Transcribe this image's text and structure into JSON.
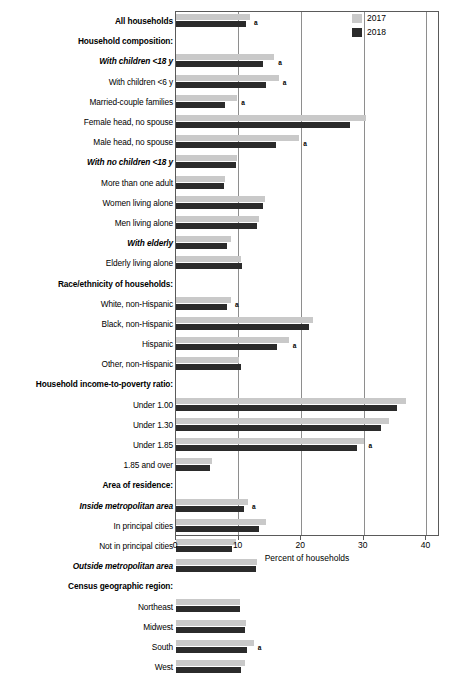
{
  "chart_data": {
    "type": "bar",
    "orientation": "horizontal",
    "title": "",
    "xlabel": "Percent of households",
    "ylabel": "",
    "xlim": [
      0,
      42
    ],
    "xticks": [
      0,
      10,
      20,
      30,
      40
    ],
    "xtick_labels": [
      "0",
      "10",
      "20",
      "30",
      "40"
    ],
    "grid": "vertical",
    "legend_position": "top-right",
    "legend": [
      {
        "name": "2017",
        "color": "#c9c9c9"
      },
      {
        "name": "2018",
        "color": "#2b2b2b"
      }
    ],
    "series": [
      {
        "name": "2017",
        "color": "#c9c9c9"
      },
      {
        "name": "2018",
        "color": "#2b2b2b"
      }
    ],
    "annotation_marker": "a",
    "rows": [
      {
        "label": "All households",
        "style": "header",
        "v2017": 11.8,
        "v2018": 11.1,
        "flag": "a"
      },
      {
        "label": "Household composition:",
        "style": "header",
        "v2017": null,
        "v2018": null,
        "flag": ""
      },
      {
        "label": "With children <18 y",
        "style": "subhead",
        "v2017": 15.7,
        "v2018": 13.9,
        "flag": "a"
      },
      {
        "label": "With children <6 y",
        "style": "normal",
        "v2017": 16.4,
        "v2018": 14.3,
        "flag": "a"
      },
      {
        "label": "Married-couple families",
        "style": "normal",
        "v2017": 9.8,
        "v2018": 7.8,
        "flag": "a"
      },
      {
        "label": "Female head, no spouse",
        "style": "normal",
        "v2017": 30.3,
        "v2018": 27.8,
        "flag": ""
      },
      {
        "label": "Male head, no spouse",
        "style": "normal",
        "v2017": 19.7,
        "v2018": 15.9,
        "flag": "a"
      },
      {
        "label": "With no children <18 y",
        "style": "subhead",
        "v2017": 9.8,
        "v2018": 9.6,
        "flag": ""
      },
      {
        "label": "More than one adult",
        "style": "normal",
        "v2017": 7.9,
        "v2018": 7.6,
        "flag": ""
      },
      {
        "label": "Women living alone",
        "style": "normal",
        "v2017": 14.2,
        "v2018": 13.9,
        "flag": ""
      },
      {
        "label": "Men living alone",
        "style": "normal",
        "v2017": 13.3,
        "v2018": 13.0,
        "flag": ""
      },
      {
        "label": "With elderly",
        "style": "subhead",
        "v2017": 8.8,
        "v2018": 8.2,
        "flag": ""
      },
      {
        "label": "Elderly living alone",
        "style": "normal",
        "v2017": 10.4,
        "v2018": 10.6,
        "flag": ""
      },
      {
        "label": "Race/ethnicity of households:",
        "style": "header",
        "v2017": null,
        "v2018": null,
        "flag": ""
      },
      {
        "label": "White, non-Hispanic",
        "style": "normal",
        "v2017": 8.8,
        "v2018": 8.1,
        "flag": "a"
      },
      {
        "label": "Black, non-Hispanic",
        "style": "normal",
        "v2017": 21.8,
        "v2018": 21.2,
        "flag": ""
      },
      {
        "label": "Hispanic",
        "style": "normal",
        "v2017": 18.0,
        "v2018": 16.2,
        "flag": "a"
      },
      {
        "label": "Other, non-Hispanic",
        "style": "normal",
        "v2017": 10.1,
        "v2018": 10.4,
        "flag": ""
      },
      {
        "label": "Household income-to-poverty ratio:",
        "style": "header",
        "v2017": null,
        "v2018": null,
        "flag": ""
      },
      {
        "label": "Under 1.00",
        "style": "normal",
        "v2017": 36.8,
        "v2018": 35.3,
        "flag": ""
      },
      {
        "label": "Under 1.30",
        "style": "normal",
        "v2017": 34.0,
        "v2018": 32.7,
        "flag": ""
      },
      {
        "label": "Under 1.85",
        "style": "normal",
        "v2017": 30.1,
        "v2018": 28.9,
        "flag": "a"
      },
      {
        "label": "1.85 and over",
        "style": "normal",
        "v2017": 5.8,
        "v2018": 5.5,
        "flag": ""
      },
      {
        "label": "Area of residence:",
        "style": "header",
        "v2017": null,
        "v2018": null,
        "flag": ""
      },
      {
        "label": "Inside metropolitan area",
        "style": "subhead",
        "v2017": 11.5,
        "v2018": 10.8,
        "flag": "a"
      },
      {
        "label": "In principal cities",
        "style": "normal",
        "v2017": 14.3,
        "v2018": 13.2,
        "flag": ""
      },
      {
        "label": "Not in principal cities",
        "style": "normal",
        "v2017": 9.6,
        "v2018": 8.9,
        "flag": ""
      },
      {
        "label": "Outside metropolitan area",
        "style": "subhead",
        "v2017": 13.0,
        "v2018": 12.7,
        "flag": ""
      },
      {
        "label": "Census geographic region:",
        "style": "header",
        "v2017": null,
        "v2018": null,
        "flag": ""
      },
      {
        "label": "Northeast",
        "style": "normal",
        "v2017": 10.2,
        "v2018": 10.2,
        "flag": ""
      },
      {
        "label": "Midwest",
        "style": "normal",
        "v2017": 11.1,
        "v2018": 11.0,
        "flag": ""
      },
      {
        "label": "South",
        "style": "normal",
        "v2017": 12.4,
        "v2018": 11.3,
        "flag": "a"
      },
      {
        "label": "West",
        "style": "normal",
        "v2017": 11.0,
        "v2018": 10.4,
        "flag": ""
      }
    ]
  }
}
